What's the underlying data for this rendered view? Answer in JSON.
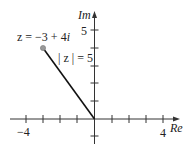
{
  "diagram": {
    "type": "complex-plane",
    "axes": {
      "x_label": "Re",
      "y_label": "Im",
      "x_tick_labels": [
        {
          "value": -4,
          "label": "−4"
        },
        {
          "value": 4,
          "label": "4"
        }
      ],
      "y_tick_labels": [
        {
          "value": 5,
          "label": "5"
        }
      ],
      "x_ticks": [
        -4,
        -3,
        -2,
        -1,
        1,
        2,
        3,
        4
      ],
      "y_ticks": [
        -1,
        1,
        2,
        3,
        4,
        5
      ]
    },
    "point": {
      "label": "z = −3 + 4i",
      "label_prefix": "z = −3 + 4",
      "label_i": "i",
      "real": -3,
      "imag": 4
    },
    "modulus_label": "| z | = 5",
    "colors": {
      "axis": "#333333",
      "segment": "#111111",
      "point": "#999999"
    }
  }
}
